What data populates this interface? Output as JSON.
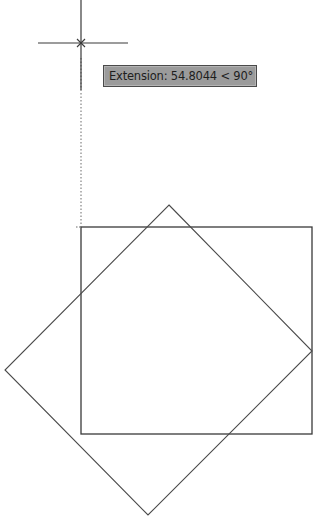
{
  "drawing": {
    "background": "#ffffff",
    "line_color": "#3a3a3a",
    "crosshair": {
      "center": [
        81,
        43
      ],
      "horizontal_extent": [
        38,
        128
      ],
      "vertical_extent": [
        0,
        90
      ]
    },
    "extension_line": {
      "style": "dotted",
      "from": [
        81,
        90
      ],
      "to": [
        81,
        227
      ]
    },
    "rectangle": {
      "top_left": [
        81,
        227
      ],
      "bottom_right": [
        312,
        434
      ]
    },
    "rotated_square": {
      "top": [
        169,
        205
      ],
      "right": [
        312,
        351
      ],
      "bottom": [
        148,
        515
      ],
      "left": [
        5,
        370
      ]
    }
  },
  "tooltip": {
    "label": "Extension: 54.8044 < 90°",
    "background": "#9b9b9b",
    "border": "#4a4a4a"
  }
}
